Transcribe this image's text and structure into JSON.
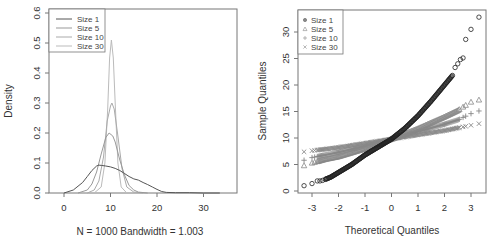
{
  "chart_data": [
    {
      "type": "line",
      "title": "",
      "xlabel": "N = 1000   Bandwidth = 1.003",
      "ylabel": "Density",
      "xlim": [
        -3,
        37
      ],
      "ylim": [
        0,
        0.6
      ],
      "xticks": [
        0,
        10,
        20,
        30
      ],
      "yticks": [
        0.0,
        0.1,
        0.2,
        0.3,
        0.4,
        0.5,
        0.6
      ],
      "ytick_labels": [
        "0.0",
        "0.1",
        "0.2",
        "0.3",
        "0.4",
        "0.5",
        "0.6"
      ],
      "grid": false,
      "legend_position": "topleft",
      "series": [
        {
          "name": "Size 1",
          "color": "#555555",
          "x": [
            0,
            2,
            4,
            5,
            6,
            7,
            7.5,
            8,
            9,
            10,
            11,
            12,
            13,
            14,
            15,
            16,
            17,
            18,
            19,
            20,
            21,
            22,
            24,
            27,
            30,
            33.5
          ],
          "y": [
            0.0,
            0.01,
            0.035,
            0.055,
            0.075,
            0.09,
            0.093,
            0.092,
            0.09,
            0.087,
            0.082,
            0.075,
            0.065,
            0.055,
            0.047,
            0.043,
            0.035,
            0.028,
            0.02,
            0.012,
            0.005,
            0.002,
            0.001,
            0.001,
            0.0,
            0.0
          ]
        },
        {
          "name": "Size 5",
          "color": "#999999",
          "x": [
            3,
            5,
            6,
            7,
            8,
            9,
            9.7,
            10.5,
            11,
            12,
            13,
            14,
            15,
            16,
            18
          ],
          "y": [
            0.0,
            0.01,
            0.03,
            0.07,
            0.13,
            0.185,
            0.2,
            0.19,
            0.17,
            0.11,
            0.06,
            0.025,
            0.01,
            0.003,
            0.0
          ]
        },
        {
          "name": "Size 10",
          "color": "#aaaaaa",
          "x": [
            5,
            6.5,
            7.5,
            8.5,
            9.3,
            10,
            10.3,
            10.8,
            11.5,
            12.5,
            13.5,
            15,
            17
          ],
          "y": [
            0.0,
            0.01,
            0.04,
            0.12,
            0.24,
            0.29,
            0.3,
            0.28,
            0.2,
            0.08,
            0.02,
            0.003,
            0.0
          ]
        },
        {
          "name": "Size 30",
          "color": "#bbbbbb",
          "x": [
            6.5,
            8,
            8.8,
            9.4,
            9.8,
            10.2,
            10.6,
            11,
            11.6,
            12.3,
            13.5
          ],
          "y": [
            0.0,
            0.02,
            0.1,
            0.28,
            0.45,
            0.51,
            0.45,
            0.3,
            0.1,
            0.02,
            0.0
          ]
        }
      ]
    },
    {
      "type": "scatter",
      "title": "",
      "xlabel": "Theoretical Quantiles",
      "ylabel": "Sample Quantiles",
      "xlim": [
        -3.5,
        3.5
      ],
      "ylim": [
        -0.8,
        34.5
      ],
      "xticks": [
        -3,
        -2,
        -1,
        0,
        1,
        2,
        3
      ],
      "yticks": [
        0,
        5,
        10,
        15,
        20,
        25,
        30
      ],
      "grid": false,
      "legend_position": "topleft",
      "series": [
        {
          "name": "Size 1",
          "marker": "circle",
          "color": "#222222",
          "x": [
            -3.3,
            -3.0,
            -2.8,
            -2.7,
            -2.6,
            -2.5,
            -2.3,
            -2.0,
            -1.5,
            -1.0,
            -0.5,
            0.0,
            0.5,
            1.0,
            1.5,
            2.0,
            2.3,
            2.4,
            2.5,
            2.6,
            2.7,
            2.8,
            3.0,
            3.3
          ],
          "y": [
            1.0,
            1.4,
            1.9,
            1.9,
            2.0,
            2.2,
            2.6,
            3.5,
            5.0,
            6.8,
            8.3,
            9.8,
            11.8,
            14.2,
            17.0,
            20.0,
            21.8,
            23.3,
            24.0,
            24.8,
            25.1,
            28.6,
            30.5,
            32.8
          ]
        },
        {
          "name": "Size 5",
          "marker": "triangle",
          "color": "#888888",
          "x": [
            -3.3,
            -3.0,
            -2.5,
            -2.0,
            -1.0,
            0.0,
            1.0,
            2.0,
            2.5,
            2.8,
            3.0,
            3.3
          ],
          "y": [
            4.8,
            5.3,
            6.0,
            6.5,
            8.0,
            9.8,
            11.8,
            14.0,
            15.2,
            16.2,
            16.8,
            17.2
          ]
        },
        {
          "name": "Size 10",
          "marker": "plus",
          "color": "#888888",
          "x": [
            -3.3,
            -3.0,
            -2.5,
            -2.0,
            -1.0,
            0.0,
            1.0,
            2.0,
            2.5,
            3.0,
            3.3
          ],
          "y": [
            5.8,
            6.3,
            6.8,
            7.3,
            8.5,
            9.8,
            11.2,
            12.6,
            13.4,
            14.6,
            15.1
          ]
        },
        {
          "name": "Size 30",
          "marker": "x",
          "color": "#888888",
          "x": [
            -3.3,
            -3.0,
            -2.5,
            -2.0,
            -1.0,
            0.0,
            1.0,
            2.0,
            2.5,
            3.0,
            3.3
          ],
          "y": [
            7.4,
            7.6,
            7.9,
            8.2,
            9.0,
            9.8,
            10.6,
            11.4,
            11.9,
            12.4,
            12.7
          ]
        }
      ]
    }
  ]
}
